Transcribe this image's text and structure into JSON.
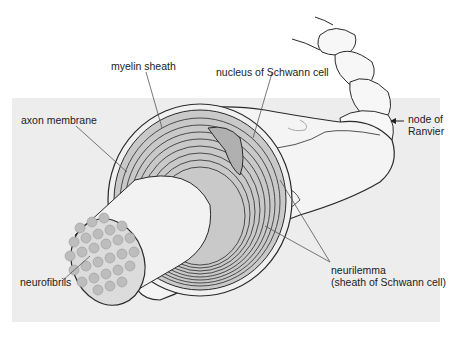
{
  "figure": {
    "colors": {
      "panel_bg": "#ededed",
      "page_bg": "#ffffff",
      "outline": "#2a2a2a",
      "myelin_fill": "#c9c9c9",
      "axon_fill": "#f2f2f2",
      "fibril_fill": "#bdbdbd",
      "nucleus_fill": "#b0b0b0",
      "leader_line": "#555555"
    },
    "labels": {
      "myelin_sheath": "myelin sheath",
      "nucleus": "nucleus of Schwann cell",
      "axon_membrane": "axon membrane",
      "node_line1": "node of",
      "node_line2": "Ranvier",
      "neurofibrils": "neurofibrils",
      "neurilemma_line1": "neurilemma",
      "neurilemma_line2": "(sheath of Schwann cell)"
    }
  }
}
